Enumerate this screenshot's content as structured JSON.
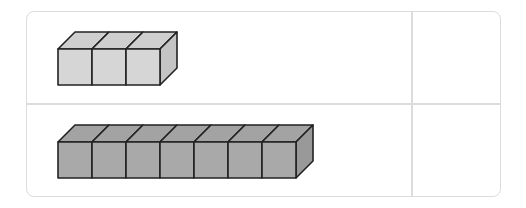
{
  "table": {
    "rows": [
      {
        "cube_count": 3,
        "answer": "",
        "fill_front": "#d6d6d6",
        "fill_top": "#cfcfcf",
        "fill_side": "#c4c4c4"
      },
      {
        "cube_count": 7,
        "answer": "",
        "fill_front": "#a9a9a9",
        "fill_top": "#a3a3a3",
        "fill_side": "#999999"
      }
    ]
  },
  "colors": {
    "border": "#dcdcdc",
    "stroke": "#222222"
  }
}
